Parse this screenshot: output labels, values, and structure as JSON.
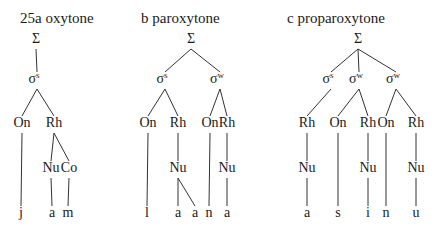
{
  "figure": {
    "number": "25",
    "panels": [
      {
        "id": "a",
        "title": "25a  oxytone",
        "title_x": 20,
        "nodes": [
          {
            "id": "S",
            "label": "Σ",
            "x": 36,
            "y": 43
          },
          {
            "id": "s1",
            "label": "σ",
            "sup": "s",
            "x": 37,
            "y": 83
          },
          {
            "id": "On1",
            "label": "On",
            "x": 22,
            "y": 127
          },
          {
            "id": "Rh1",
            "label": "Rh",
            "x": 54,
            "y": 127
          },
          {
            "id": "Nu1",
            "label": "Nu",
            "x": 51,
            "y": 172
          },
          {
            "id": "Co1",
            "label": "Co",
            "x": 69,
            "y": 172
          }
        ],
        "terminals": [
          {
            "label": "j",
            "x": 21
          },
          {
            "label": "a",
            "x": 52
          },
          {
            "label": "m",
            "x": 68
          }
        ],
        "edges": [
          [
            "S",
            "s1"
          ],
          [
            "s1",
            "On1"
          ],
          [
            "s1",
            "Rh1"
          ],
          [
            "Rh1",
            "Nu1"
          ],
          [
            "Rh1",
            "Co1"
          ],
          [
            "On1",
            "t0"
          ],
          [
            "Nu1",
            "t1"
          ],
          [
            "Co1",
            "t2"
          ]
        ]
      },
      {
        "id": "b",
        "title": "b  paroxytone",
        "title_x": 141,
        "nodes": [
          {
            "id": "S",
            "label": "Σ",
            "x": 191,
            "y": 43
          },
          {
            "id": "s1",
            "label": "σ",
            "sup": "s",
            "x": 165,
            "y": 83
          },
          {
            "id": "s2",
            "label": "σ",
            "sup": "w",
            "x": 220,
            "y": 83
          },
          {
            "id": "On1",
            "label": "On",
            "x": 148,
            "y": 127
          },
          {
            "id": "Rh1",
            "label": "Rh",
            "x": 178,
            "y": 127
          },
          {
            "id": "On2",
            "label": "On",
            "x": 210,
            "y": 127
          },
          {
            "id": "Rh2",
            "label": "Rh",
            "x": 227,
            "y": 127
          },
          {
            "id": "Nu1",
            "label": "Nu",
            "x": 178,
            "y": 172
          },
          {
            "id": "Nu2",
            "label": "Nu",
            "x": 227,
            "y": 172
          }
        ],
        "terminals": [
          {
            "label": "l",
            "x": 147
          },
          {
            "label": "a",
            "x": 178
          },
          {
            "label": "a",
            "x": 195
          },
          {
            "label": "n",
            "x": 209
          },
          {
            "label": "a",
            "x": 227
          }
        ],
        "edges": [
          [
            "S",
            "s1"
          ],
          [
            "S",
            "s2"
          ],
          [
            "s1",
            "On1"
          ],
          [
            "s1",
            "Rh1"
          ],
          [
            "s2",
            "On2"
          ],
          [
            "s2",
            "Rh2"
          ],
          [
            "Rh1",
            "Nu1"
          ],
          [
            "Rh2",
            "Nu2"
          ],
          [
            "On1",
            "t0"
          ],
          [
            "Nu1",
            "t1"
          ],
          [
            "Nu1",
            "t2"
          ],
          [
            "On2",
            "t3"
          ],
          [
            "Nu2",
            "t4"
          ]
        ]
      },
      {
        "id": "c",
        "title": "c  proparoxytone",
        "title_x": 287,
        "nodes": [
          {
            "id": "S",
            "label": "Σ",
            "x": 358,
            "y": 43
          },
          {
            "id": "s1",
            "label": "σ",
            "sup": "s",
            "x": 331,
            "y": 83
          },
          {
            "id": "s2",
            "label": "σ",
            "sup": "w",
            "x": 359,
            "y": 83
          },
          {
            "id": "s3",
            "label": "σ",
            "sup": "w",
            "x": 396,
            "y": 83
          },
          {
            "id": "Rh1",
            "label": "Rh",
            "x": 307,
            "y": 127
          },
          {
            "id": "On2",
            "label": "On",
            "x": 338,
            "y": 127
          },
          {
            "id": "Rh2",
            "label": "Rh",
            "x": 368,
            "y": 127
          },
          {
            "id": "On3",
            "label": "On",
            "x": 386,
            "y": 127
          },
          {
            "id": "Rh3",
            "label": "Rh",
            "x": 416,
            "y": 127
          },
          {
            "id": "Nu1",
            "label": "Nu",
            "x": 307,
            "y": 172
          },
          {
            "id": "Nu2",
            "label": "Nu",
            "x": 368,
            "y": 172
          },
          {
            "id": "Nu3",
            "label": "Nu",
            "x": 416,
            "y": 172
          }
        ],
        "terminals": [
          {
            "label": "a",
            "x": 307
          },
          {
            "label": "s",
            "x": 338
          },
          {
            "label": "i",
            "x": 368
          },
          {
            "label": "n",
            "x": 386
          },
          {
            "label": "u",
            "x": 416
          }
        ],
        "edges": [
          [
            "S",
            "s1"
          ],
          [
            "S",
            "s2"
          ],
          [
            "S",
            "s3"
          ],
          [
            "s1",
            "Rh1"
          ],
          [
            "s2",
            "On2"
          ],
          [
            "s2",
            "Rh2"
          ],
          [
            "s3",
            "On3"
          ],
          [
            "s3",
            "Rh3"
          ],
          [
            "Rh1",
            "Nu1"
          ],
          [
            "Rh2",
            "Nu2"
          ],
          [
            "Rh3",
            "Nu3"
          ],
          [
            "Nu1",
            "t0"
          ],
          [
            "On2",
            "t1"
          ],
          [
            "Nu2",
            "t2"
          ],
          [
            "On3",
            "t3"
          ],
          [
            "Nu3",
            "t4"
          ]
        ]
      }
    ],
    "terminal_y": 217,
    "title_y": 23
  }
}
